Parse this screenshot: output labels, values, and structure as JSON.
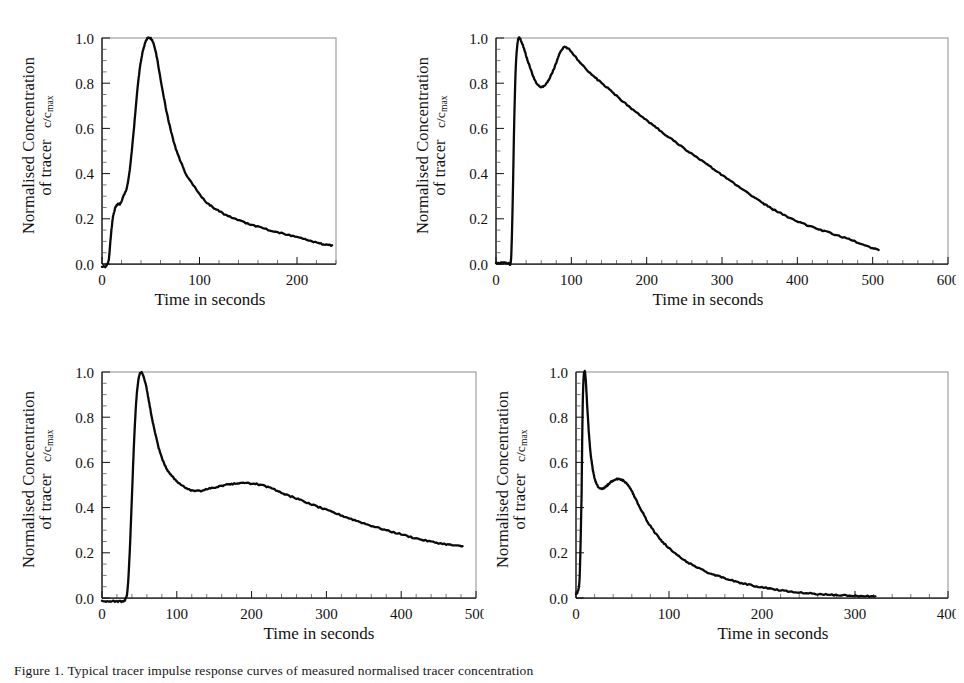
{
  "figure": {
    "caption": "Figure 1.  Typical tracer impulse response curves of measured normalised tracer concentration",
    "axis_label_y_line1": "Normalised Concentration",
    "axis_label_y_line2": "of tracer",
    "axis_label_y_symbol": "c/c",
    "axis_label_y_symbol_sub": "max",
    "axis_label_x": "Time in seconds",
    "line_color": "#0a0a0a",
    "frame_color": "#8c8c8c",
    "axis_color": "#111111",
    "background": "#ffffff"
  },
  "chart_data": [
    {
      "id": "panel-top-left",
      "type": "line",
      "title": "",
      "xlabel": "Time in seconds",
      "ylabel": "Normalised Concentration of tracer c/cmax",
      "xlim": [
        0,
        240
      ],
      "ylim": [
        0.0,
        1.0
      ],
      "xticks": [
        0,
        100,
        200
      ],
      "yticks": [
        0.0,
        0.2,
        0.4,
        0.6,
        0.8,
        1.0
      ],
      "x_minor_step": 20,
      "y_minor_step": 0.05,
      "grid": false,
      "legend": "none",
      "x": [
        0,
        4,
        7,
        9,
        11,
        13,
        15,
        17,
        19,
        22,
        25,
        28,
        31,
        34,
        37,
        40,
        43,
        46,
        49,
        52,
        55,
        58,
        62,
        66,
        70,
        75,
        80,
        86,
        92,
        100,
        108,
        116,
        125,
        134,
        144,
        154,
        165,
        176,
        188,
        200,
        212,
        222,
        230,
        236
      ],
      "y": [
        -0.01,
        -0.01,
        0.02,
        0.12,
        0.2,
        0.24,
        0.26,
        0.265,
        0.268,
        0.3,
        0.33,
        0.4,
        0.52,
        0.66,
        0.8,
        0.9,
        0.96,
        0.995,
        1.0,
        0.985,
        0.94,
        0.87,
        0.77,
        0.68,
        0.6,
        0.52,
        0.46,
        0.4,
        0.36,
        0.31,
        0.27,
        0.245,
        0.222,
        0.204,
        0.187,
        0.172,
        0.158,
        0.145,
        0.132,
        0.119,
        0.104,
        0.092,
        0.085,
        0.083
      ]
    },
    {
      "id": "panel-top-right",
      "type": "line",
      "title": "",
      "xlabel": "Time in seconds",
      "ylabel": "Normalised Concentration of tracer c/cmax",
      "xlim": [
        0,
        600
      ],
      "ylim": [
        0.0,
        1.0
      ],
      "xticks": [
        0,
        100,
        200,
        300,
        400,
        500,
        600
      ],
      "yticks": [
        0.0,
        0.2,
        0.4,
        0.6,
        0.8,
        1.0
      ],
      "x_minor_step": 20,
      "y_minor_step": 0.05,
      "grid": false,
      "legend": "none",
      "x": [
        0,
        6,
        12,
        17,
        20,
        22,
        24,
        26,
        28,
        30,
        33,
        37,
        41,
        45,
        50,
        55,
        60,
        65,
        70,
        75,
        80,
        85,
        90,
        95,
        101,
        108,
        116,
        125,
        135,
        146,
        158,
        170,
        182,
        195,
        208,
        222,
        236,
        250,
        264,
        278,
        292,
        306,
        320,
        334,
        346,
        356,
        366,
        378,
        392,
        406,
        420,
        436,
        452,
        468,
        484,
        498,
        508
      ],
      "y": [
        0.005,
        0.005,
        0.005,
        0.005,
        0.02,
        0.25,
        0.6,
        0.85,
        0.96,
        1.0,
        0.99,
        0.955,
        0.91,
        0.87,
        0.825,
        0.795,
        0.783,
        0.79,
        0.815,
        0.85,
        0.89,
        0.935,
        0.958,
        0.955,
        0.935,
        0.905,
        0.875,
        0.845,
        0.815,
        0.785,
        0.75,
        0.715,
        0.682,
        0.648,
        0.615,
        0.58,
        0.545,
        0.51,
        0.478,
        0.445,
        0.412,
        0.38,
        0.348,
        0.315,
        0.288,
        0.265,
        0.245,
        0.225,
        0.2,
        0.18,
        0.163,
        0.145,
        0.128,
        0.11,
        0.09,
        0.073,
        0.062
      ]
    },
    {
      "id": "panel-bottom-left",
      "type": "line",
      "title": "",
      "xlabel": "Time in seconds",
      "ylabel": "Normalised Concentration of tracer c/cmax",
      "xlim": [
        0,
        500
      ],
      "ylim": [
        0.0,
        1.0
      ],
      "xticks": [
        0,
        100,
        200,
        300,
        400,
        500
      ],
      "yticks": [
        0.0,
        0.2,
        0.4,
        0.6,
        0.8,
        1.0
      ],
      "x_minor_step": 20,
      "y_minor_step": 0.05,
      "grid": false,
      "legend": "none",
      "x": [
        0,
        8,
        16,
        24,
        30,
        34,
        37,
        40,
        43,
        46,
        49,
        52,
        55,
        58,
        62,
        66,
        70,
        75,
        80,
        86,
        92,
        99,
        106,
        113,
        120,
        128,
        136,
        145,
        155,
        165,
        175,
        185,
        195,
        205,
        215,
        225,
        236,
        248,
        260,
        272,
        285,
        298,
        312,
        326,
        340,
        355,
        370,
        385,
        400,
        415,
        430,
        445,
        460,
        472,
        482
      ],
      "y": [
        -0.015,
        -0.015,
        -0.015,
        -0.015,
        -0.012,
        0.03,
        0.2,
        0.45,
        0.7,
        0.88,
        0.97,
        1.0,
        0.985,
        0.95,
        0.885,
        0.81,
        0.745,
        0.675,
        0.62,
        0.575,
        0.545,
        0.52,
        0.5,
        0.485,
        0.475,
        0.473,
        0.478,
        0.485,
        0.492,
        0.5,
        0.505,
        0.508,
        0.508,
        0.505,
        0.498,
        0.487,
        0.472,
        0.455,
        0.44,
        0.425,
        0.408,
        0.392,
        0.375,
        0.358,
        0.342,
        0.325,
        0.31,
        0.295,
        0.282,
        0.268,
        0.256,
        0.246,
        0.238,
        0.232,
        0.229
      ]
    },
    {
      "id": "panel-bottom-right",
      "type": "line",
      "title": "",
      "xlabel": "Time in seconds",
      "ylabel": "Normalised Concentration of tracer c/cmax",
      "xlim": [
        0,
        400
      ],
      "ylim": [
        0.0,
        1.0
      ],
      "xticks": [
        0,
        100,
        200,
        300,
        400
      ],
      "yticks": [
        0.0,
        0.2,
        0.4,
        0.6,
        0.8,
        1.0
      ],
      "x_minor_step": 20,
      "y_minor_step": 0.05,
      "grid": false,
      "legend": "none",
      "x": [
        0,
        2,
        4,
        6,
        7,
        8,
        9,
        10,
        11,
        12,
        14,
        16,
        18,
        20,
        22,
        25,
        28,
        31,
        34,
        37,
        40,
        44,
        48,
        52,
        56,
        60,
        64,
        68,
        73,
        78,
        84,
        90,
        97,
        104,
        112,
        120,
        129,
        138,
        148,
        158,
        168,
        178,
        190,
        202,
        214,
        226,
        238,
        250,
        262,
        275,
        288,
        300,
        312,
        322
      ],
      "y": [
        0.02,
        0.03,
        0.1,
        0.45,
        0.8,
        0.96,
        1.0,
        0.99,
        0.93,
        0.85,
        0.72,
        0.63,
        0.57,
        0.53,
        0.505,
        0.488,
        0.482,
        0.49,
        0.5,
        0.512,
        0.52,
        0.527,
        0.525,
        0.515,
        0.498,
        0.472,
        0.44,
        0.405,
        0.368,
        0.33,
        0.295,
        0.262,
        0.232,
        0.205,
        0.18,
        0.158,
        0.138,
        0.12,
        0.103,
        0.09,
        0.077,
        0.066,
        0.055,
        0.046,
        0.038,
        0.031,
        0.026,
        0.021,
        0.017,
        0.014,
        0.011,
        0.009,
        0.008,
        0.007
      ]
    }
  ],
  "panels": [
    {
      "name": "top-left"
    },
    {
      "name": "top-right"
    },
    {
      "name": "bottom-left"
    },
    {
      "name": "bottom-right"
    }
  ]
}
